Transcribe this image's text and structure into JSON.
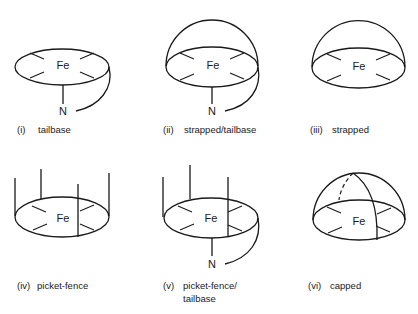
{
  "figure": {
    "atoms": {
      "iron": "Fe",
      "nitrogen": "N"
    },
    "panels": [
      {
        "numeral": "(i)",
        "label": "tailbase",
        "features": [
          "porphyrin-disc",
          "iron-center",
          "tail-base-N"
        ]
      },
      {
        "numeral": "(ii)",
        "label": "strapped/tailbase",
        "features": [
          "porphyrin-disc",
          "iron-center",
          "strap-dome",
          "tail-base-N"
        ]
      },
      {
        "numeral": "(iii)",
        "label": "strapped",
        "features": [
          "porphyrin-disc",
          "iron-center",
          "strap-dome"
        ]
      },
      {
        "numeral": "(iv)",
        "label": "picket-fence",
        "features": [
          "porphyrin-disc",
          "iron-center",
          "four-pickets"
        ]
      },
      {
        "numeral": "(v)",
        "label_line1": "picket-fence/",
        "label_line2": "tailbase",
        "features": [
          "porphyrin-disc",
          "iron-center",
          "three-pickets",
          "tail-base-N"
        ]
      },
      {
        "numeral": "(vi)",
        "label": "capped",
        "features": [
          "porphyrin-disc",
          "iron-center",
          "cap-dome"
        ]
      }
    ]
  }
}
